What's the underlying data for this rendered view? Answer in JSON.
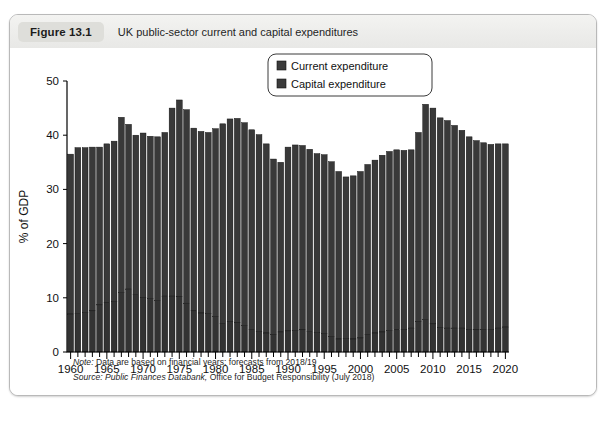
{
  "figure": {
    "number": "Figure 13.1",
    "title": "UK public-sector current and capital expenditures"
  },
  "notes": {
    "note_label": "Note:",
    "note_text": " Data are based on financial years; forecasts from 2018/19",
    "source_label": "Source:",
    "source_italic": " Public Finances Databank,",
    "source_text": " Office for Budget Responsibility (July 2018)"
  },
  "colors": {
    "current": "#393939",
    "capital": "#333333",
    "card_border": "#b9b9b9",
    "caption_bg": "#eeeeec",
    "badge_bg": "#dededa"
  },
  "chart_data": {
    "type": "bar",
    "stacked": true,
    "title": "UK public-sector current and capital expenditures",
    "xlabel": "",
    "ylabel": "% of GDP",
    "ylim": [
      0,
      50
    ],
    "ytick_values": [
      0,
      10,
      20,
      30,
      40,
      50
    ],
    "ytick_labels": [
      "0",
      "10",
      "20",
      "30",
      "40",
      "50"
    ],
    "xtick_values": [
      1960,
      1965,
      1970,
      1975,
      1980,
      1985,
      1990,
      1995,
      2000,
      2005,
      2010,
      2015,
      2020
    ],
    "xtick_labels": [
      "1960",
      "1965",
      "1970",
      "1975",
      "1980",
      "1985",
      "1990",
      "1995",
      "2000",
      "2005",
      "2010",
      "2015",
      "2020"
    ],
    "grid": false,
    "legend_position": "top-right",
    "legend": [
      "Current expenditure",
      "Capital expenditure"
    ],
    "categories": [
      1960,
      1961,
      1962,
      1963,
      1964,
      1965,
      1966,
      1967,
      1968,
      1969,
      1970,
      1971,
      1972,
      1973,
      1974,
      1975,
      1976,
      1977,
      1978,
      1979,
      1980,
      1981,
      1982,
      1983,
      1984,
      1985,
      1986,
      1987,
      1988,
      1989,
      1990,
      1991,
      1992,
      1993,
      1994,
      1995,
      1996,
      1997,
      1998,
      1999,
      2000,
      2001,
      2002,
      2003,
      2004,
      2005,
      2006,
      2007,
      2008,
      2009,
      2010,
      2011,
      2012,
      2013,
      2014,
      2015,
      2016,
      2017,
      2018,
      2019,
      2020
    ],
    "series": [
      {
        "name": "Capital expenditure",
        "values": [
          7.0,
          7.1,
          7.3,
          7.6,
          8.7,
          9.1,
          9.3,
          11.0,
          11.6,
          10.6,
          10.1,
          9.9,
          9.5,
          10.3,
          10.3,
          10.2,
          9.0,
          7.6,
          7.2,
          7.1,
          6.6,
          5.3,
          5.6,
          5.4,
          4.9,
          4.2,
          3.8,
          3.5,
          3.2,
          3.7,
          3.9,
          4.0,
          4.1,
          3.8,
          3.6,
          3.4,
          2.9,
          2.4,
          2.5,
          2.4,
          2.6,
          3.2,
          3.5,
          3.7,
          4.0,
          4.1,
          4.2,
          4.4,
          5.6,
          6.0,
          5.2,
          4.5,
          4.4,
          4.4,
          4.4,
          4.2,
          4.1,
          4.2,
          4.2,
          4.4,
          4.6
        ]
      },
      {
        "name": "Current expenditure",
        "values": [
          29.5,
          30.6,
          30.4,
          30.2,
          29.1,
          29.3,
          29.6,
          32.3,
          30.4,
          29.4,
          30.3,
          29.9,
          30.2,
          30.2,
          34.7,
          36.3,
          35.7,
          33.7,
          33.5,
          33.4,
          34.6,
          36.8,
          37.4,
          37.7,
          37.4,
          36.8,
          36.3,
          34.9,
          32.4,
          31.3,
          33.9,
          34.2,
          34.0,
          33.6,
          33.0,
          33.0,
          32.2,
          30.9,
          29.8,
          30.1,
          30.7,
          31.4,
          31.9,
          32.6,
          33.0,
          33.2,
          33.0,
          32.9,
          34.9,
          39.7,
          39.8,
          38.7,
          38.3,
          37.4,
          36.5,
          35.5,
          34.9,
          34.4,
          34.1,
          34.0,
          33.8
        ]
      }
    ],
    "totals": [
      36.5,
      37.7,
      37.7,
      37.8,
      37.8,
      38.4,
      38.9,
      43.3,
      42.0,
      40.0,
      40.4,
      39.8,
      39.7,
      40.5,
      45.0,
      46.5,
      44.7,
      41.3,
      40.7,
      40.5,
      41.2,
      42.1,
      43.0,
      43.1,
      42.3,
      41.0,
      40.1,
      38.4,
      35.6,
      35.0,
      37.8,
      38.2,
      38.1,
      37.4,
      36.6,
      36.4,
      35.1,
      33.3,
      32.3,
      32.5,
      33.3,
      34.6,
      35.4,
      36.3,
      37.0,
      37.3,
      37.2,
      37.3,
      40.5,
      45.7,
      45.0,
      43.2,
      42.7,
      41.8,
      40.9,
      39.7,
      39.0,
      38.6,
      38.3,
      38.4,
      38.4
    ]
  }
}
